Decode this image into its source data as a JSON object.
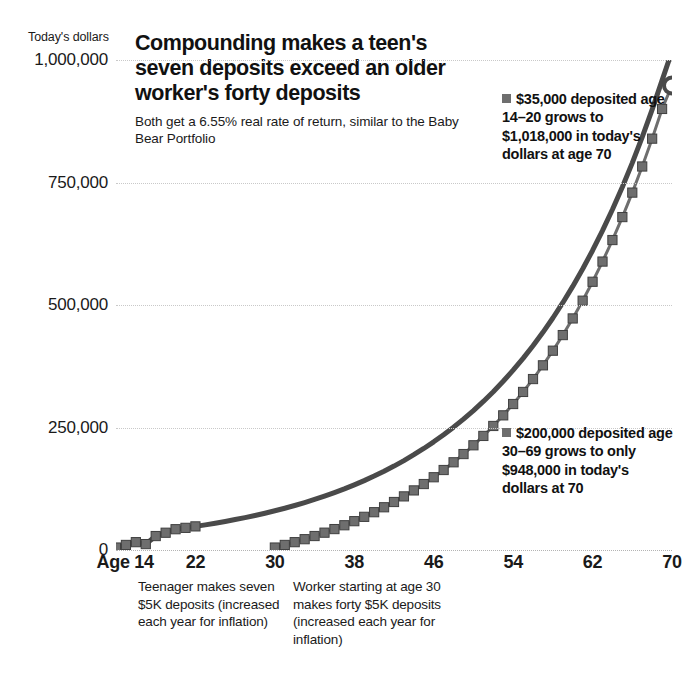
{
  "header": {
    "title": "Compounding makes a teen's seven deposits exceed an older worker's forty deposits",
    "subtitle": "Both get a 6.55% real rate of return, similar to the Baby Bear Portfolio"
  },
  "annotations": {
    "teen": "$35,000 deposited age 14–20 grows to $1,018,000 in today's dollars at age 70",
    "worker": "$200,000 deposited age 30–69 grows to only $948,000 in today's dollars at 70"
  },
  "footnotes": {
    "teen": "Teenager makes seven $5K deposits (increased each year for inflation)",
    "worker": "Worker starting at age 30 makes forty $5K deposits (increased each year for inflation)"
  },
  "colors": {
    "teen_line": "#4a4a4a",
    "worker_line": "#6e6e6e",
    "marker": "#6e6e6e",
    "gridline": "#c9c9c9",
    "text": "#1a1a1a"
  },
  "chart_data": {
    "type": "line",
    "title": "Compounding makes a teen's seven deposits exceed an older worker's forty deposits",
    "subtitle": "Both get a 6.55% real rate of return, similar to the Baby Bear Portfolio",
    "xlabel": "Age",
    "ylabel": "Today's dollars",
    "xlim": [
      14,
      70
    ],
    "ylim": [
      0,
      1000000
    ],
    "xticks": [
      14,
      22,
      30,
      38,
      46,
      54,
      62,
      70
    ],
    "xticklabels": [
      "Age 14",
      "22",
      "30",
      "38",
      "46",
      "54",
      "62",
      "70"
    ],
    "yticks": [
      0,
      250000,
      500000,
      750000,
      1000000
    ],
    "yticklabels": [
      "0",
      "250,000",
      "500,000",
      "750,000",
      "1,000,000"
    ],
    "grid": true,
    "legend": false,
    "rate_of_return_pct": 6.55,
    "series": [
      {
        "name": "Teenager: seven $5K deposits, age 14–20",
        "marker": "square-then-smooth",
        "endpoint_marker": "open-circle",
        "start_age": 14,
        "end_age": 70,
        "end_value": 1018000,
        "x": [
          14,
          15,
          16,
          17,
          18,
          19,
          20,
          21,
          22,
          23,
          24,
          25,
          26,
          27,
          28,
          29,
          30,
          31,
          32,
          33,
          34,
          35,
          36,
          37,
          38,
          39,
          40,
          41,
          42,
          43,
          44,
          45,
          46,
          47,
          48,
          49,
          50,
          51,
          52,
          53,
          54,
          55,
          56,
          57,
          58,
          59,
          60,
          61,
          62,
          63,
          64,
          65,
          66,
          67,
          68,
          69,
          70
        ],
        "values": [
          5000,
          10328,
          16005,
          12053,
          28457,
          35243,
          42434,
          45214,
          48176,
          51330,
          54691,
          58272,
          62088,
          66152,
          70484,
          75099,
          80016,
          85255,
          90838,
          96786,
          103125,
          109878,
          117074,
          124742,
          132910,
          141614,
          150887,
          160767,
          171294,
          182510,
          194461,
          207197,
          220768,
          235232,
          250646,
          267075,
          284586,
          303252,
          323149,
          344360,
          366974,
          391084,
          416794,
          444212,
          473454,
          504646,
          537920,
          573420,
          611300,
          651723,
          694865,
          740913,
          790069,
          842546,
          898577,
          958405,
          1018000
        ]
      },
      {
        "name": "Worker: forty $5K deposits, age 30–69",
        "marker": "square",
        "endpoint_marker": "open-circle",
        "start_age": 30,
        "end_age": 70,
        "end_value": 948000,
        "x": [
          30,
          31,
          32,
          33,
          34,
          35,
          36,
          37,
          38,
          39,
          40,
          41,
          42,
          43,
          44,
          45,
          46,
          47,
          48,
          49,
          50,
          51,
          52,
          53,
          54,
          55,
          56,
          57,
          58,
          59,
          60,
          61,
          62,
          63,
          64,
          65,
          66,
          67,
          68,
          69,
          70
        ],
        "values": [
          5000,
          10328,
          16005,
          22055,
          28503,
          35375,
          42700,
          50507,
          58828,
          67697,
          77150,
          87226,
          97965,
          109411,
          121611,
          134616,
          148478,
          163255,
          179007,
          195798,
          213697,
          232778,
          253120,
          274805,
          297924,
          322572,
          348852,
          376872,
          406749,
          438607,
          472578,
          508804,
          547435,
          588632,
          632566,
          679419,
          729386,
          782672,
          839498,
          900098,
          948000
        ]
      }
    ]
  }
}
